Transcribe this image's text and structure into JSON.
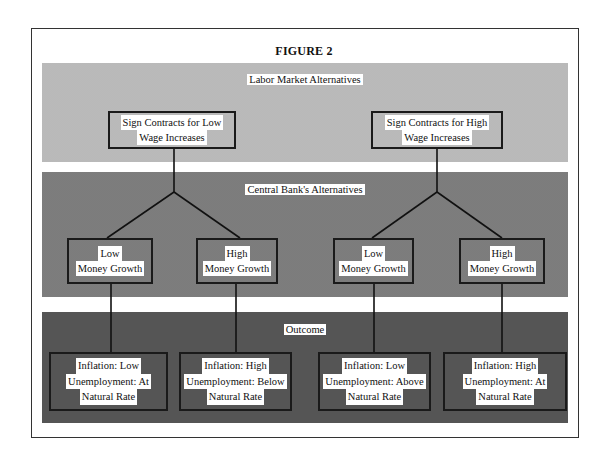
{
  "figure": {
    "title": "FIGURE 2"
  },
  "sections": {
    "labor_market": {
      "label": "Labor Market Alternatives",
      "options": [
        {
          "line1": "Sign Contracts for Low",
          "line2": "Wage Increases"
        },
        {
          "line1": "Sign Contracts for High",
          "line2": "Wage Increases"
        }
      ]
    },
    "central_bank": {
      "label": "Central Bank's Alternatives",
      "options": [
        {
          "line1": "Low",
          "line2": "Money Growth"
        },
        {
          "line1": "High",
          "line2": "Money Growth"
        },
        {
          "line1": "Low",
          "line2": "Money Growth"
        },
        {
          "line1": "High",
          "line2": "Money Growth"
        }
      ]
    },
    "outcome": {
      "label": "Outcome",
      "results": [
        {
          "line1": "Inflation: Low",
          "line2": "Unemployment: At",
          "line3": "Natural Rate"
        },
        {
          "line1": "Inflation: High",
          "line2": "Unemployment: Below",
          "line3": "Natural Rate"
        },
        {
          "line1": "Inflation: Low",
          "line2": "Unemployment: Above",
          "line3": "Natural Rate"
        },
        {
          "line1": "Inflation: High",
          "line2": "Unemployment: At",
          "line3": "Natural Rate"
        }
      ]
    }
  }
}
